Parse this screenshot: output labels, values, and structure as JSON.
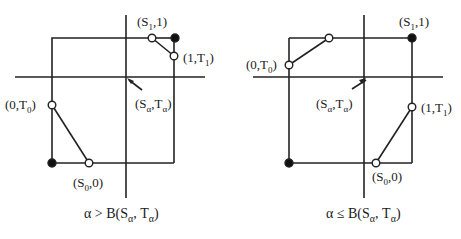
{
  "diagrams": [
    {
      "id": "left",
      "caption": {
        "pre": "α > B(S",
        "sub1": "α",
        "mid": ", T",
        "sub2": "α",
        "post": ")"
      },
      "labels": {
        "s1": {
          "pre": "(S",
          "sub": "1",
          "post": ",1)"
        },
        "t1": {
          "pre": "(1,T",
          "sub": "1",
          "post": ")"
        },
        "t0": {
          "pre": "(0,T",
          "sub": "0",
          "post": ")"
        },
        "s0": {
          "pre": "(S",
          "sub": "0",
          "post": ",0)"
        },
        "sa": {
          "pre": "(S",
          "sub1": "α",
          "mid": ",T",
          "sub2": "α",
          "post": ")"
        }
      }
    },
    {
      "id": "right",
      "caption": {
        "pre": "α ≤ B(S",
        "sub1": "α",
        "mid": ", T",
        "sub2": "α",
        "post": ")"
      },
      "labels": {
        "s1": {
          "pre": "(S",
          "sub": "1",
          "post": ",1)"
        },
        "t1": {
          "pre": "(1,T",
          "sub": "1",
          "post": ")"
        },
        "t0": {
          "pre": "(0,T",
          "sub": "0",
          "post": ")"
        },
        "s0": {
          "pre": "(S",
          "sub": "0",
          "post": ",0)"
        },
        "sa": {
          "pre": "(S",
          "sub1": "α",
          "mid": ",T",
          "sub2": "α",
          "post": ")"
        }
      }
    }
  ]
}
